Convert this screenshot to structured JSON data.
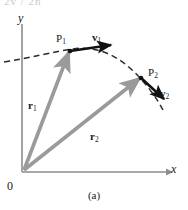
{
  "figure": {
    "caption": "(a)",
    "cropped_header_text": "2v / 2n",
    "axes": {
      "y_label": "y",
      "x_label": "x",
      "origin_label": "0"
    },
    "points": [
      {
        "id": "P1",
        "label": "P",
        "subscript": "1"
      },
      {
        "id": "P2",
        "label": "P",
        "subscript": "2"
      }
    ],
    "vectors": [
      {
        "id": "v1",
        "label": "v",
        "subscript": "1",
        "kind": "velocity",
        "color": "#111111"
      },
      {
        "id": "v2",
        "label": "v",
        "subscript": "2",
        "kind": "velocity",
        "color": "#111111"
      },
      {
        "id": "r1",
        "label": "r",
        "subscript": "1",
        "kind": "position",
        "color": "#9a9a9a"
      },
      {
        "id": "r2",
        "label": "r",
        "subscript": "2",
        "kind": "position",
        "color": "#9a9a9a"
      }
    ],
    "trajectory": {
      "style": "dashed",
      "color": "#2b2b2b"
    },
    "colors": {
      "axis": "#8d8d8d",
      "position_vector": "#9a9a9a",
      "velocity_vector": "#111111",
      "trajectory": "#2b2b2b",
      "text": "#1a1a1a",
      "background": "#ffffff"
    }
  }
}
